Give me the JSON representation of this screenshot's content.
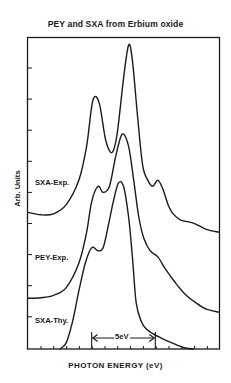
{
  "chart_data": {
    "type": "line",
    "title": "PEY and SXA from Erbium  oxide",
    "xlabel": "PHOTON ENERGY (eV)",
    "ylabel": "Arb. Units",
    "grid": false,
    "legend": "inline labels at left of each curve",
    "x_unit_note": "x positions expressed in eV relative to left axis edge, using 5 eV scale bar (~64 px per 5 eV)",
    "xlim": [
      0,
      15
    ],
    "ylim": [
      0,
      1
    ],
    "annotations": [
      {
        "text": "5eV",
        "type": "scale-bar",
        "x_start": 5.0,
        "x_end": 10.0
      }
    ],
    "series": [
      {
        "name": "SXA-Exp.",
        "label": "SXA-Exp.",
        "x": [
          0.0,
          1.0,
          2.0,
          3.0,
          4.0,
          4.6,
          5.1,
          5.6,
          6.1,
          6.6,
          7.0,
          7.5,
          7.9,
          8.2,
          8.6,
          9.0,
          9.4,
          9.8,
          10.2,
          10.6,
          11.0,
          11.4,
          12.0,
          13.0,
          14.0,
          15.0
        ],
        "y": [
          0.445,
          0.437,
          0.44,
          0.47,
          0.55,
          0.66,
          0.81,
          0.8,
          0.68,
          0.64,
          0.7,
          0.88,
          0.99,
          0.94,
          0.76,
          0.6,
          0.55,
          0.53,
          0.55,
          0.52,
          0.47,
          0.44,
          0.42,
          0.41,
          0.39,
          0.38
        ]
      },
      {
        "name": "PEY-Exp.",
        "label": "PEY-Exp.",
        "x": [
          0.0,
          1.0,
          2.0,
          3.0,
          4.0,
          4.6,
          5.0,
          5.5,
          5.9,
          6.4,
          6.9,
          7.4,
          7.9,
          8.3,
          8.7,
          9.1,
          9.6,
          10.2,
          10.8,
          11.5,
          12.3,
          13.2,
          14.0,
          15.0
        ],
        "y": [
          0.165,
          0.167,
          0.175,
          0.2,
          0.28,
          0.38,
          0.48,
          0.53,
          0.51,
          0.53,
          0.63,
          0.7,
          0.66,
          0.55,
          0.43,
          0.36,
          0.32,
          0.3,
          0.26,
          0.22,
          0.18,
          0.15,
          0.13,
          0.12
        ]
      },
      {
        "name": "SXA-Thy.",
        "label": "SXA-Thy.",
        "x": [
          2.5,
          3.0,
          3.5,
          4.0,
          4.5,
          5.0,
          5.5,
          5.9,
          6.3,
          6.7,
          7.1,
          7.5,
          7.9,
          8.2,
          8.5,
          8.9,
          9.3,
          9.8,
          10.5,
          11.3,
          12.2,
          13.0
        ],
        "y": [
          0.0,
          0.02,
          0.09,
          0.19,
          0.28,
          0.33,
          0.32,
          0.33,
          0.4,
          0.48,
          0.54,
          0.53,
          0.43,
          0.3,
          0.15,
          0.09,
          0.065,
          0.05,
          0.035,
          0.02,
          0.005,
          0.0
        ]
      }
    ],
    "y_ticks_count": 9,
    "x_ticks_count": 14
  }
}
